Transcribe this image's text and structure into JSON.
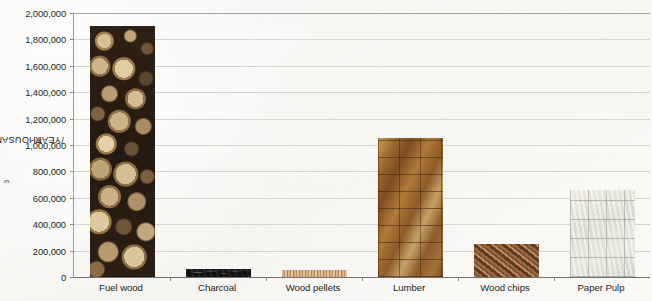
{
  "chart_data": {
    "type": "bar",
    "title": "",
    "xlabel": "",
    "ylabel": "THOUSANDS OF m3/YEAR",
    "ylabel_parts": {
      "prefix": "THOUSANDS OF m",
      "sup": "3",
      "suffix": "/YEAR"
    },
    "categories": [
      "Fuel wood",
      "Charcoal",
      "Wood pellets",
      "Lumber",
      "Wood chips",
      "Paper Pulp"
    ],
    "values": [
      1900000,
      60000,
      55000,
      1050000,
      250000,
      660000
    ],
    "ylim": [
      0,
      2000000
    ],
    "ytick_values": [
      2000000,
      1800000,
      1600000,
      1400000,
      1200000,
      1000000,
      800000,
      600000,
      400000,
      200000,
      0
    ],
    "ytick_labels": [
      "2,000,000",
      "1,800,000",
      "1,600,000",
      "1,400,000",
      "1,200,000",
      "1,000,000",
      "800,000",
      "600,000",
      "400,000",
      "200,000",
      "0"
    ],
    "grid": true,
    "legend": "none",
    "bar_textures": [
      "fuelwood",
      "charcoal",
      "pellets",
      "lumber",
      "chips",
      "pulp"
    ],
    "bar_colors": [
      "#2a1d13",
      "#17161a",
      "#c79a6a",
      "#8a5a2c",
      "#6a4228",
      "#dddcd4"
    ],
    "axis_color": "#6f6f6c",
    "gridline_color": "#d6d4d0",
    "text_color": "#231f20",
    "background_color": "#f7f6f3"
  }
}
